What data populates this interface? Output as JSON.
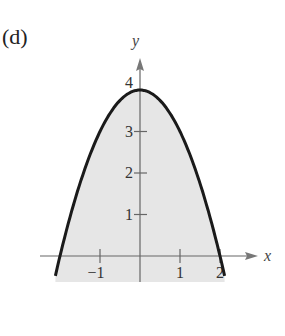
{
  "panel_label": "(d)",
  "chart_data": {
    "type": "area",
    "title": "",
    "equation": "y = 4 - x^2",
    "xlabel": "x",
    "ylabel": "y",
    "x_ticks": [
      -1,
      1,
      2
    ],
    "x_tick_labels": [
      "−1",
      "1",
      "2"
    ],
    "y_ticks": [
      1,
      2,
      3,
      4
    ],
    "y_tick_labels": [
      "1",
      "2",
      "3",
      "4"
    ],
    "xlim": [
      -2.3,
      2.6
    ],
    "ylim": [
      -0.65,
      4.6
    ],
    "grid": false,
    "shaded_region": "below curve",
    "series": [
      {
        "name": "y = 4 - x^2",
        "x": [
          -2.2,
          -2,
          -1.5,
          -1,
          -0.5,
          0,
          0.5,
          1,
          1.5,
          2,
          2.2
        ],
        "values": [
          -0.84,
          0,
          1.75,
          3,
          3.75,
          4,
          3.75,
          3,
          1.75,
          0,
          -0.84
        ]
      }
    ],
    "colors": {
      "curve": "#1a1a1a",
      "fill": "#e6e6e6",
      "axis": "#555555"
    }
  }
}
